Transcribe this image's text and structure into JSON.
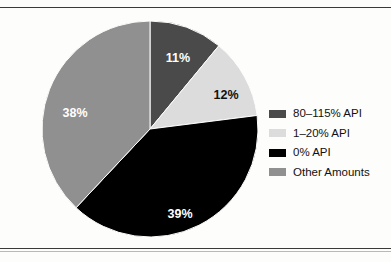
{
  "chart_data": {
    "type": "pie",
    "title": "",
    "subtitle": "",
    "xlabel": "",
    "ylabel": "",
    "grid": false,
    "legend_position": "right",
    "start_angle_deg": 0,
    "direction": "clockwise",
    "center": {
      "x": 150,
      "y": 121
    },
    "radius": 108,
    "categories": [
      "80–115% API",
      "1–20% API",
      "0% API",
      "Other Amounts"
    ],
    "values": [
      11,
      12,
      39,
      38
    ],
    "value_unit": "%",
    "slices": [
      {
        "label": "80–115% API",
        "value": 11,
        "data_label": "11%",
        "color": "#4a4a4a",
        "label_color": "#ffffff",
        "label_x": 178,
        "label_y": 51
      },
      {
        "label": "1–20% API",
        "value": 12,
        "data_label": "12%",
        "color": "#dcdcdc",
        "label_color": "#111111",
        "label_x": 226,
        "label_y": 88
      },
      {
        "label": "0% API",
        "value": 39,
        "data_label": "39%",
        "color": "#000000",
        "label_color": "#ffffff",
        "label_x": 180,
        "label_y": 207
      },
      {
        "label": "Other Amounts",
        "value": 38,
        "data_label": "38%",
        "color": "#909090",
        "label_color": "#ffffff",
        "label_x": 75,
        "label_y": 106
      }
    ]
  },
  "legend": {
    "items": [
      {
        "label": "80–115% API",
        "color": "#4a4a4a"
      },
      {
        "label": "1–20% API",
        "color": "#dcdcdc"
      },
      {
        "label": "0% API",
        "color": "#000000"
      },
      {
        "label": "Other Amounts",
        "color": "#909090"
      }
    ]
  },
  "colors": {
    "background": "#fdfdfc",
    "rule": "#3a3a3a",
    "dark_gray": "#4a4a4a",
    "light_gray": "#dcdcdc",
    "black": "#000000",
    "medium_gray": "#909090"
  }
}
